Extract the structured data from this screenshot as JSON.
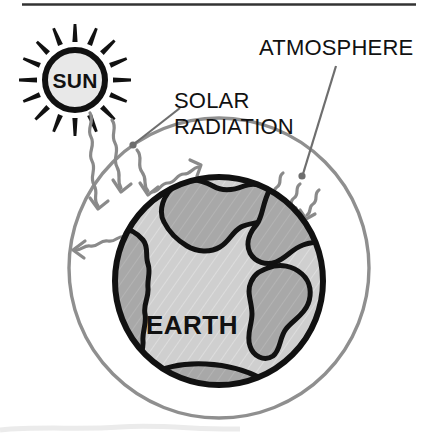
{
  "diagram": {
    "title_rule": "top-divider-rule",
    "background_color": "#ffffff",
    "labels": {
      "sun": "SUN",
      "earth": "EARTH",
      "atmosphere": "ATMOSPHERE",
      "solar_radiation_line1": "SOLAR",
      "solar_radiation_line2": "RADIATION"
    },
    "colors": {
      "ink": "#111111",
      "sun_fill": "#e8e8e8",
      "ocean_fill": "#cfcfcf",
      "land_fill": "#a8a8a8",
      "atmosphere_stroke": "#8f8f8f",
      "ray_arrow_stroke": "#8a8a8a",
      "leader_stroke": "#6e6e6e",
      "divider": "#333333"
    },
    "elements": {
      "sun_circle": {
        "cx": 75,
        "cy": 80,
        "r": 30
      },
      "sun_ray_count": 16,
      "atmosphere_circle": {
        "cx": 219,
        "cy": 268,
        "r": 150
      },
      "earth_circle": {
        "cx": 219,
        "cy": 281,
        "r": 107
      },
      "incoming_wavy_arrows": 5,
      "outgoing_wavy_arrows": 2,
      "leader_lines": 2
    }
  }
}
